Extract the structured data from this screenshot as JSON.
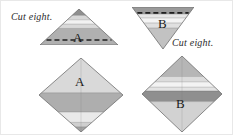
{
  "figure": {
    "background_color": "#ffffff",
    "width": 233,
    "height": 135
  },
  "palette": {
    "stripe_dark": "#8f8f8f",
    "stripe_mid_dark": "#9a9a9a",
    "stripe_mid": "#b4b4b4",
    "stripe_light": "#d0d0d0",
    "stripe_lighter": "#e2e2e2",
    "stripe_lightest": "#efefef",
    "stripe_white": "#f7f7f7",
    "outline": "#6e6e6e",
    "dash_line": "#1f1f1f",
    "text": "#1a1a1a",
    "caption_text": "#2b2b2b"
  },
  "captions": [
    {
      "id": "caption-left",
      "text": "Cut eight.",
      "x": 10,
      "y": 10
    },
    {
      "id": "caption-right",
      "text": "Cut eight.",
      "x": 171,
      "y": 36
    }
  ],
  "units": [
    {
      "id": "unit-a-triangle",
      "label": "A",
      "shape": "triangle-up",
      "position": {
        "x": 39,
        "y": 8
      },
      "size": {
        "width": 78,
        "height": 36
      },
      "has_cut_line": true,
      "cut_line_style": "dashed",
      "stripes": [
        {
          "color": "#8f8f8f",
          "from": 0.0,
          "to": 0.18
        },
        {
          "color": "#d7d7d7",
          "from": 0.18,
          "to": 0.3
        },
        {
          "color": "#f2f2f2",
          "from": 0.3,
          "to": 0.42
        },
        {
          "color": "#d9d9d9",
          "from": 0.42,
          "to": 0.54
        },
        {
          "color": "#b0b0b0",
          "from": 0.54,
          "to": 1.0
        }
      ]
    },
    {
      "id": "unit-b-triangle",
      "label": "B",
      "shape": "triangle-down",
      "position": {
        "x": 131,
        "y": 6
      },
      "size": {
        "width": 62,
        "height": 42
      },
      "has_cut_line": true,
      "cut_line_style": "dashed",
      "stripes": [
        {
          "color": "#9a9a9a",
          "from": 0.0,
          "to": 0.17
        },
        {
          "color": "#e6e6e6",
          "from": 0.17,
          "to": 0.26
        },
        {
          "color": "#f4f4f4",
          "from": 0.26,
          "to": 0.38
        },
        {
          "color": "#e0e0e0",
          "from": 0.38,
          "to": 0.5
        },
        {
          "color": "#c2c2c2",
          "from": 0.5,
          "to": 1.0
        }
      ]
    },
    {
      "id": "unit-a-diamond",
      "label": "A",
      "shape": "diamond",
      "position": {
        "x": 38,
        "y": 57
      },
      "size": {
        "width": 84,
        "height": 74
      },
      "has_cut_line": false,
      "cut_line_style": "none",
      "stripes": [
        {
          "color": "#d9d9d9",
          "from": 0.0,
          "to": 0.47
        },
        {
          "color": "#aeaeae",
          "from": 0.47,
          "to": 0.73
        },
        {
          "color": "#e9e9e9",
          "from": 0.73,
          "to": 0.87
        },
        {
          "color": "#cfcfcf",
          "from": 0.87,
          "to": 0.93
        },
        {
          "color": "#a3a3a3",
          "from": 0.93,
          "to": 1.0
        }
      ]
    },
    {
      "id": "unit-b-diamond",
      "label": "B",
      "shape": "diamond",
      "position": {
        "x": 141,
        "y": 55
      },
      "size": {
        "width": 80,
        "height": 76
      },
      "has_cut_line": false,
      "cut_line_style": "none",
      "stripes": [
        {
          "color": "#b6b6b6",
          "from": 0.0,
          "to": 0.27
        },
        {
          "color": "#dcdcdc",
          "from": 0.27,
          "to": 0.34
        },
        {
          "color": "#f3f3f3",
          "from": 0.34,
          "to": 0.41
        },
        {
          "color": "#e3e3e3",
          "from": 0.41,
          "to": 0.46
        },
        {
          "color": "#8f8f8f",
          "from": 0.46,
          "to": 0.6
        },
        {
          "color": "#d2d2d2",
          "from": 0.6,
          "to": 1.0
        }
      ]
    }
  ],
  "labels": [
    {
      "id": "label-a-triangle",
      "text": "A",
      "x": 72,
      "y": 29,
      "size": "large"
    },
    {
      "id": "label-b-triangle",
      "text": "B",
      "x": 157,
      "y": 15,
      "size": "large"
    },
    {
      "id": "label-a-diamond",
      "text": "A",
      "x": 74,
      "y": 73,
      "size": "large"
    },
    {
      "id": "label-b-diamond",
      "text": "B",
      "x": 175,
      "y": 95,
      "size": "large"
    }
  ]
}
